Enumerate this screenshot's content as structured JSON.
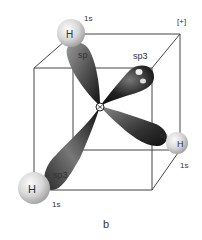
{
  "figure": {
    "caption": "b",
    "sign_label": "[+]",
    "center_atom": "C",
    "orbitals": [
      {
        "id": "upper-left",
        "label": "sp3",
        "label_visible": "sp",
        "bonded_to": "H",
        "h_label": "H",
        "h_orbital": "1s"
      },
      {
        "id": "upper-right",
        "label": "sp3",
        "label_visible": "sp3",
        "bonded_to": null
      },
      {
        "id": "lower-left",
        "label": "sp3",
        "label_visible": "sp3",
        "bonded_to": "H",
        "h_label": "H",
        "h_orbital": "1s"
      },
      {
        "id": "lower-right",
        "label": "sp3",
        "label_visible": "sp",
        "bonded_to": "H",
        "h_label": "H",
        "h_orbital": "1s"
      }
    ],
    "colors": {
      "lobe_dark": "#1a1a1a",
      "lobe_mid": "#6a6a6a",
      "lobe_light": "#9a9a9a",
      "sphere_light": "#f4f4f4",
      "sphere_dark": "#a8a8a8",
      "cube_line": "#444444"
    }
  }
}
